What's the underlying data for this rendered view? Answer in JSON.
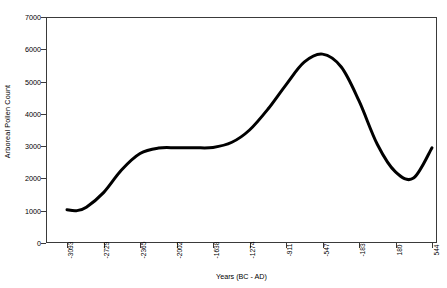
{
  "chart_data": {
    "type": "line",
    "title": "",
    "xlabel": "Years (BC - AD)",
    "ylabel": "Arboreal Pollen Count",
    "ylim": [
      0,
      7000
    ],
    "y_ticks": [
      0,
      1000,
      2000,
      3000,
      4000,
      5000,
      6000,
      7000
    ],
    "y_tick_labels": [
      "0",
      "1000",
      "2000",
      "3000",
      "4000",
      "5000",
      "6000",
      "7000"
    ],
    "x_tick_labels": [
      "-3093",
      "-2729",
      "-2365",
      "-2002",
      "-1638",
      "-1274",
      "-911",
      "-547",
      "-183",
      "180",
      "544"
    ],
    "x_categories": [
      -3093,
      -2729,
      -2365,
      -2002,
      -1638,
      -1274,
      -911,
      -547,
      -183,
      180,
      544
    ],
    "grid": false,
    "legend": false,
    "legend_position": "none",
    "line_color": "#000000",
    "line_width_px": 3,
    "series": [
      {
        "name": "Arboreal Pollen Count",
        "x": [
          -3093,
          -3000,
          -2900,
          -2729,
          -2550,
          -2365,
          -2180,
          -2002,
          -1820,
          -1638,
          -1450,
          -1274,
          -1090,
          -911,
          -730,
          -547,
          -360,
          -183,
          0,
          180,
          360,
          544
        ],
        "values": [
          1030,
          1000,
          1110,
          1560,
          2260,
          2770,
          2940,
          2950,
          2950,
          2960,
          3120,
          3500,
          4150,
          4900,
          5600,
          5850,
          5450,
          4400,
          3050,
          2200,
          2010,
          2950
        ]
      }
    ],
    "annotations": {
      "start_value": 1030,
      "minimum_value": 1000,
      "plateau_value": 2950,
      "peak_value": 5850,
      "peak_x_label": "-547",
      "late_trough_value": 2010,
      "end_value": 2950
    }
  },
  "axes": {
    "y_title": "Arboreal Pollen Count",
    "x_title": "Years (BC - AD)"
  }
}
